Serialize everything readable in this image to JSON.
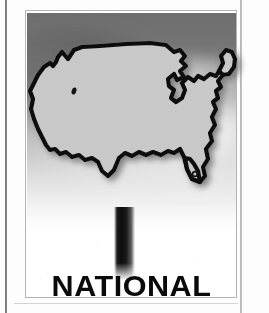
{
  "page": {
    "width": 269,
    "height": 313,
    "background_color": "#fdfdfd",
    "gutter_rule_color": "#4a4a4a",
    "bottom_rule_color": "#d2d2d2"
  },
  "figure": {
    "frame_border_color": "#b4b4b4",
    "caption_text": "NATIONAL",
    "caption_color": "#0a0a0a"
  },
  "backdrop": {
    "kind": "sky-photograph",
    "description": "grayscale sky, dark at top fading to white at bottom",
    "top_color": "#6e6e6e",
    "bottom_color": "#ffffff"
  },
  "sign": {
    "shape": "united-states-map-silhouette",
    "fill_color": "#c8c8c8",
    "outline_color": "#111111",
    "shadow_color": "#8a8a8a",
    "post_color": "#0d0d0d",
    "features": [
      {
        "name": "great-salt-lake-dot",
        "color": "#141414"
      },
      {
        "name": "lake-okeechobee-dot",
        "color": "#141414"
      }
    ]
  }
}
